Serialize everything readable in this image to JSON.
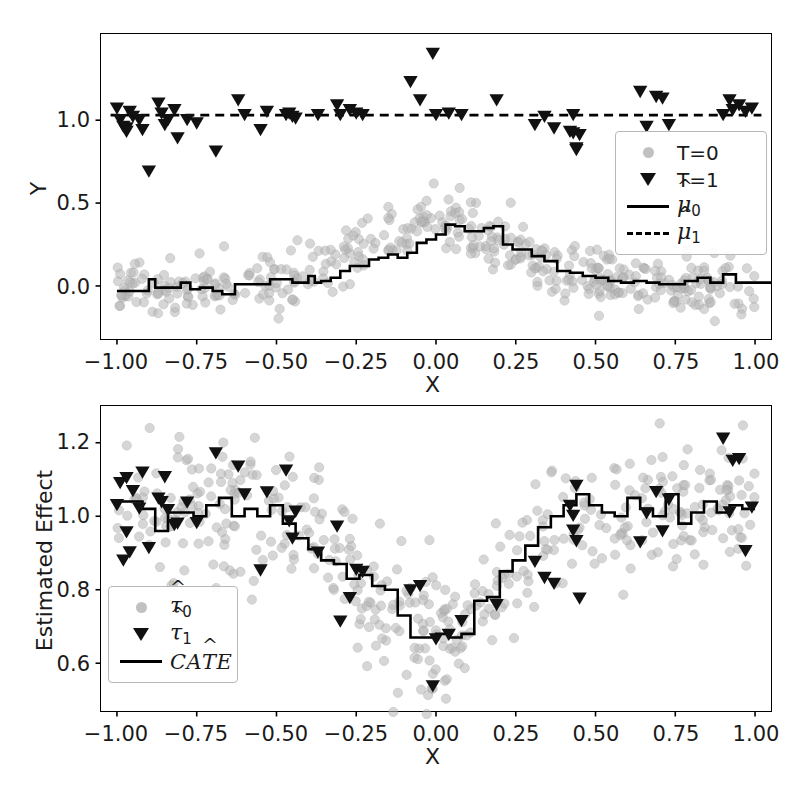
{
  "figure": {
    "width": 801,
    "height": 797,
    "background": "#ffffff",
    "scatter_color": "#b6b6b6",
    "marker_color": "#111111",
    "line_color": "#000000"
  },
  "top_panel": {
    "ylabel": "Y",
    "xlabel": "X",
    "xticks": [
      "-1.00",
      "-0.75",
      "-0.50",
      "-0.25",
      "0.00",
      "0.25",
      "0.50",
      "0.75",
      "1.00"
    ],
    "yticks": [
      "0.0",
      "0.5",
      "1.0"
    ],
    "legend": [
      {
        "key": "circle",
        "label": "T=0"
      },
      {
        "key": "triangle",
        "label": "T=1"
      },
      {
        "key": "solid",
        "label": "mu0"
      },
      {
        "key": "dashed",
        "label": "mu1"
      }
    ]
  },
  "bottom_panel": {
    "ylabel": "Estimated Effect",
    "xlabel": "X",
    "xticks": [
      "-1.00",
      "-0.75",
      "-0.50",
      "-0.25",
      "0.00",
      "0.25",
      "0.50",
      "0.75",
      "1.00"
    ],
    "yticks": [
      "0.6",
      "0.8",
      "1.0",
      "1.2"
    ],
    "legend": [
      {
        "key": "circle",
        "label": "tau0"
      },
      {
        "key": "triangle",
        "label": "tau1"
      },
      {
        "key": "solid",
        "label": "CATE"
      }
    ]
  },
  "chart_data": [
    {
      "type": "scatter",
      "panel": "top",
      "title": "",
      "xlabel": "X",
      "ylabel": "Y",
      "xlim": [
        -1.05,
        1.05
      ],
      "ylim": [
        -0.32,
        1.52
      ],
      "xticks": [
        -1.0,
        -0.75,
        -0.5,
        -0.25,
        0.0,
        0.25,
        0.5,
        0.75,
        1.0
      ],
      "yticks": [
        0.0,
        0.5,
        1.0
      ],
      "grid": false,
      "legend_position": "center-right",
      "series": [
        {
          "name": "T=0",
          "marker": "circle",
          "color": "#b6b6b6",
          "n": 440,
          "model": "bell_plus_noise",
          "description": "control outcomes scattered about a bell-shaped mean centered at x=0 with peak 0.38 and baseline 0.0, gaussian noise sd 0.09",
          "peak": 0.38,
          "baseline": 0.0,
          "bell_width": 0.22,
          "noise_sd": 0.09
        },
        {
          "name": "T=1",
          "marker": "triangle_down",
          "color": "#111111",
          "n": 56,
          "model": "constant_plus_noise",
          "description": "treated outcomes scattered about a constant mean of 1.03, gaussian noise sd 0.09, a few high outliers near x=0",
          "level": 1.03,
          "noise_sd": 0.09,
          "x": [
            -1.0,
            -0.99,
            -0.98,
            -0.97,
            -0.97,
            -0.96,
            -0.95,
            -0.93,
            -0.92,
            -0.9,
            -0.87,
            -0.86,
            -0.85,
            -0.84,
            -0.82,
            -0.81,
            -0.78,
            -0.75,
            -0.69,
            -0.62,
            -0.6,
            -0.55,
            -0.53,
            -0.47,
            -0.46,
            -0.45,
            -0.44,
            -0.37,
            -0.31,
            -0.3,
            -0.27,
            -0.25,
            -0.23,
            -0.08,
            -0.05,
            -0.01,
            0.0,
            0.04,
            0.08,
            0.19,
            0.31,
            0.34,
            0.37,
            0.42,
            0.43,
            0.43,
            0.44,
            0.44,
            0.45,
            0.64,
            0.66,
            0.69,
            0.71,
            0.73,
            0.9,
            0.92,
            0.93,
            0.95,
            0.97,
            0.99
          ],
          "y": [
            1.07,
            1.0,
            0.96,
            0.95,
            0.93,
            1.05,
            1.02,
            1.0,
            0.94,
            0.69,
            1.1,
            1.04,
            0.97,
            1.0,
            1.06,
            0.89,
            1.0,
            0.98,
            0.81,
            1.12,
            1.03,
            0.94,
            1.05,
            1.03,
            1.04,
            1.02,
            1.01,
            1.03,
            1.09,
            1.03,
            1.06,
            1.04,
            1.03,
            1.23,
            1.12,
            1.4,
            1.03,
            1.04,
            1.03,
            1.12,
            0.97,
            1.02,
            0.95,
            0.93,
            1.03,
            0.92,
            0.83,
            0.82,
            0.91,
            1.17,
            0.96,
            1.14,
            1.13,
            0.97,
            1.03,
            1.12,
            1.06,
            1.09,
            1.05,
            1.07
          ]
        }
      ],
      "lines": [
        {
          "name": "mu0_hat",
          "style": "solid",
          "color": "#000000",
          "drawstyle": "steps",
          "description": "piecewise-constant regression estimate of control response; flat near 0 on the tails, rising to a peak of about 0.38 near x=0.0-0.1",
          "x": [
            -1.0,
            -0.96,
            -0.92,
            -0.9,
            -0.88,
            -0.84,
            -0.8,
            -0.77,
            -0.74,
            -0.7,
            -0.67,
            -0.63,
            -0.6,
            -0.56,
            -0.52,
            -0.49,
            -0.45,
            -0.42,
            -0.4,
            -0.38,
            -0.36,
            -0.33,
            -0.3,
            -0.27,
            -0.24,
            -0.21,
            -0.18,
            -0.15,
            -0.12,
            -0.09,
            -0.06,
            -0.03,
            0.0,
            0.03,
            0.06,
            0.09,
            0.12,
            0.15,
            0.18,
            0.21,
            0.24,
            0.27,
            0.3,
            0.34,
            0.38,
            0.42,
            0.46,
            0.5,
            0.54,
            0.58,
            0.62,
            0.66,
            0.7,
            0.74,
            0.78,
            0.82,
            0.86,
            0.9,
            0.94,
            1.0
          ],
          "y": [
            -0.03,
            -0.03,
            -0.03,
            0.04,
            -0.01,
            -0.01,
            0.02,
            -0.02,
            -0.01,
            -0.03,
            -0.05,
            0.01,
            0.01,
            0.01,
            0.04,
            0.04,
            0.02,
            0.02,
            0.06,
            0.02,
            0.03,
            0.05,
            0.09,
            0.12,
            0.12,
            0.16,
            0.17,
            0.19,
            0.17,
            0.2,
            0.26,
            0.28,
            0.31,
            0.37,
            0.36,
            0.33,
            0.33,
            0.35,
            0.36,
            0.25,
            0.22,
            0.22,
            0.18,
            0.15,
            0.09,
            0.08,
            0.06,
            0.05,
            0.03,
            0.02,
            0.03,
            0.02,
            0.01,
            0.01,
            0.03,
            0.05,
            0.02,
            0.07,
            0.02,
            0.02
          ]
        },
        {
          "name": "mu1_hat",
          "style": "dashed",
          "color": "#000000",
          "drawstyle": "steps",
          "description": "piecewise-constant regression estimate of treated response; essentially flat at about 1.03 across the whole domain",
          "level": 1.03
        }
      ]
    },
    {
      "type": "scatter",
      "panel": "bottom",
      "title": "",
      "xlabel": "X",
      "ylabel": "Estimated Effect",
      "xlim": [
        -1.05,
        1.05
      ],
      "ylim": [
        0.47,
        1.3
      ],
      "xticks": [
        -1.0,
        -0.75,
        -0.5,
        -0.25,
        0.0,
        0.25,
        0.5,
        0.75,
        1.0
      ],
      "yticks": [
        0.6,
        0.8,
        1.0,
        1.2
      ],
      "grid": false,
      "legend_position": "lower-left",
      "series": [
        {
          "name": "tau0_hat",
          "marker": "circle",
          "color": "#b6b6b6",
          "n": 440,
          "model": "inverted_bell_plus_noise",
          "description": "per-unit estimated effects for control units; mean follows 1.03 minus a bell dip to about 0.67 at x=0, gaussian noise sd 0.09",
          "level": 1.03,
          "dip": 0.36,
          "bell_width": 0.22,
          "noise_sd": 0.09
        },
        {
          "name": "tau1_hat",
          "marker": "triangle_down",
          "color": "#111111",
          "n": 56,
          "model": "inverted_bell_plus_noise",
          "description": "per-unit estimated effects for treated units, same mean curve as control effects",
          "level": 1.03,
          "dip": 0.36,
          "bell_width": 0.22,
          "noise_sd": 0.09
        }
      ],
      "lines": [
        {
          "name": "CATE_hat",
          "style": "solid",
          "color": "#000000",
          "drawstyle": "steps",
          "description": "piecewise-constant CATE estimate; about 1.03 on the tails with a sharp dip to roughly 0.67 near x=0",
          "x": [
            -1.0,
            -0.96,
            -0.92,
            -0.88,
            -0.84,
            -0.8,
            -0.76,
            -0.72,
            -0.68,
            -0.64,
            -0.6,
            -0.56,
            -0.52,
            -0.48,
            -0.44,
            -0.4,
            -0.36,
            -0.32,
            -0.28,
            -0.24,
            -0.2,
            -0.16,
            -0.12,
            -0.08,
            -0.04,
            0.0,
            0.04,
            0.08,
            0.12,
            0.16,
            0.2,
            0.24,
            0.28,
            0.32,
            0.36,
            0.4,
            0.44,
            0.48,
            0.52,
            0.56,
            0.6,
            0.64,
            0.68,
            0.72,
            0.76,
            0.8,
            0.84,
            0.88,
            0.92,
            0.96,
            1.0
          ],
          "y": [
            1.04,
            1.04,
            1.02,
            0.96,
            1.01,
            1.01,
            1.0,
            1.03,
            1.05,
            1.0,
            1.02,
            1.0,
            1.03,
            0.98,
            0.94,
            0.91,
            0.88,
            0.87,
            0.83,
            0.84,
            0.81,
            0.8,
            0.73,
            0.67,
            0.67,
            0.68,
            0.67,
            0.68,
            0.77,
            0.78,
            0.85,
            0.88,
            0.92,
            0.97,
            1.0,
            1.03,
            1.06,
            1.03,
            1.01,
            1.0,
            1.05,
            1.02,
            1.0,
            1.06,
            0.98,
            1.01,
            1.04,
            1.01,
            1.03,
            1.02,
            1.02
          ]
        }
      ]
    }
  ]
}
